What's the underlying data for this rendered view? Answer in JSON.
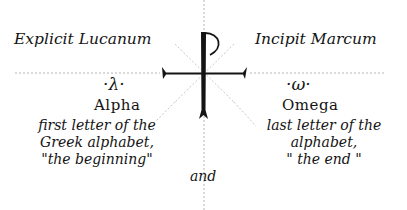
{
  "headers": {
    "left": "Explicit Lucanum",
    "right": "Incipit Marcum"
  },
  "symbols": {
    "center": "staurogram",
    "left_glyph": "·λ·",
    "right_glyph": "·ω·"
  },
  "alpha": {
    "name": "Alpha",
    "lines": [
      "first letter of the",
      "Greek alphabet,",
      "\"the beginning\""
    ]
  },
  "omega": {
    "name": "Omega",
    "lines": [
      "last letter of the",
      "alphabet,",
      "\" the end \""
    ]
  },
  "connector": "and",
  "colors": {
    "ink": "#141414",
    "guide": "#b5b5b5",
    "background": "#ffffff"
  }
}
